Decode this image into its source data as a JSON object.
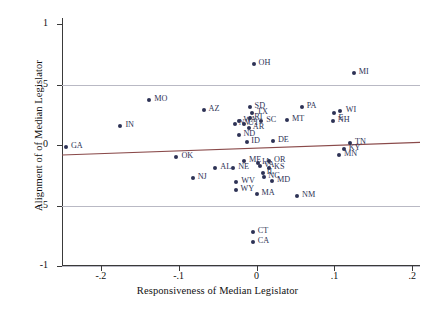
{
  "chart_data": {
    "type": "scatter",
    "title": "",
    "xlabel": "Responsiveness of Median Legislator",
    "ylabel": "Alignment of of Median Legislator",
    "xlim": [
      -0.25,
      0.21
    ],
    "ylim": [
      -1.0,
      1.05
    ],
    "xticks": [
      -0.2,
      -0.1,
      0,
      0.1,
      0.2
    ],
    "xticklabels": [
      "-.2",
      "-.1",
      "0",
      ".1",
      ".2"
    ],
    "yticks": [
      -1,
      -0.5,
      0,
      0.5,
      1
    ],
    "yticklabels": [
      "-1",
      "-.5",
      "0",
      ".5",
      "1"
    ],
    "gridlines_y": [
      -1,
      -0.5,
      0.5
    ],
    "grid": true,
    "legend": "none",
    "marker_color": "#2d3255",
    "fit_line_color": "#8a4a4a",
    "grid_color": "#b9b9c4",
    "fit_line": {
      "x0": -0.25,
      "y0": -0.082,
      "x1": 0.21,
      "y1": 0.022
    },
    "points": [
      {
        "label": "GA",
        "x": -0.245,
        "y": -0.012,
        "lab_dx": 5,
        "lab_dy": 0
      },
      {
        "label": "IN",
        "x": -0.175,
        "y": 0.155,
        "lab_dx": 5,
        "lab_dy": 0
      },
      {
        "label": "MO",
        "x": -0.138,
        "y": 0.372,
        "lab_dx": 5,
        "lab_dy": 0
      },
      {
        "label": "OK",
        "x": -0.103,
        "y": -0.098,
        "lab_dx": 5,
        "lab_dy": 0
      },
      {
        "label": "NJ",
        "x": -0.082,
        "y": -0.272,
        "lab_dx": 5,
        "lab_dy": 0
      },
      {
        "label": "AZ",
        "x": -0.068,
        "y": 0.288,
        "lab_dx": 5,
        "lab_dy": 0
      },
      {
        "label": "AL",
        "x": -0.053,
        "y": -0.192,
        "lab_dx": 5,
        "lab_dy": 0
      },
      {
        "label": "NE",
        "x": -0.03,
        "y": -0.192,
        "lab_dx": 5,
        "lab_dy": 0
      },
      {
        "label": "WV",
        "x": -0.026,
        "y": -0.305,
        "lab_dx": 5,
        "lab_dy": 0
      },
      {
        "label": "WY",
        "x": -0.027,
        "y": -0.372,
        "lab_dx": 5,
        "lab_dy": 0
      },
      {
        "label": "ME",
        "x": -0.016,
        "y": -0.128,
        "lab_dx": 5,
        "lab_dy": 0
      },
      {
        "label": "MT",
        "x": 0.039,
        "y": 0.205,
        "lab_dx": 5,
        "lab_dy": 0
      },
      {
        "label": "SD",
        "x": -0.009,
        "y": 0.318,
        "lab_dx": 5,
        "lab_dy": 0
      },
      {
        "label": "TX",
        "x": -0.006,
        "y": 0.268,
        "lab_dx": 5,
        "lab_dy": 0
      },
      {
        "label": "RI",
        "x": -0.008,
        "y": 0.222,
        "lab_dx": 4,
        "lab_dy": 0
      },
      {
        "label": "SC",
        "x": 0.006,
        "y": 0.198,
        "lab_dx": 5,
        "lab_dy": 0
      },
      {
        "label": "WA",
        "x": -0.022,
        "y": 0.195,
        "lab_dx": 4,
        "lab_dy": 0
      },
      {
        "label": "NV",
        "x": -0.028,
        "y": 0.172,
        "lab_dx": 4,
        "lab_dy": 0
      },
      {
        "label": "UT",
        "x": -0.016,
        "y": 0.172,
        "lab_dx": 4,
        "lab_dy": 0
      },
      {
        "label": "AR",
        "x": -0.01,
        "y": 0.138,
        "lab_dx": 4,
        "lab_dy": 0
      },
      {
        "label": "ND",
        "x": -0.022,
        "y": 0.085,
        "lab_dx": 4,
        "lab_dy": 0
      },
      {
        "label": "ID",
        "x": -0.012,
        "y": 0.022,
        "lab_dx": 4,
        "lab_dy": 0
      },
      {
        "label": "DE",
        "x": 0.021,
        "y": 0.035,
        "lab_dx": 5,
        "lab_dy": 0
      },
      {
        "label": "OH",
        "x": -0.004,
        "y": 0.668,
        "lab_dx": 5,
        "lab_dy": 0
      },
      {
        "label": "PA",
        "x": 0.058,
        "y": 0.318,
        "lab_dx": 5,
        "lab_dy": 0
      },
      {
        "label": "MI",
        "x": 0.125,
        "y": 0.592,
        "lab_dx": 5,
        "lab_dy": 0
      },
      {
        "label": "WI",
        "x": 0.107,
        "y": 0.282,
        "lab_dx": 6,
        "lab_dy": 0
      },
      {
        "label": "E",
        "x": 0.099,
        "y": 0.268,
        "lab_dx": 5,
        "lab_dy": 6
      },
      {
        "label": "NH",
        "x": 0.098,
        "y": 0.2,
        "lab_dx": 5,
        "lab_dy": 0
      },
      {
        "label": "KY",
        "x": 0.112,
        "y": -0.032,
        "lab_dx": 5,
        "lab_dy": 0
      },
      {
        "label": "TN",
        "x": 0.12,
        "y": 0.018,
        "lab_dx": 5,
        "lab_dy": 0
      },
      {
        "label": "MN",
        "x": 0.106,
        "y": -0.082,
        "lab_dx": 5,
        "lab_dy": 0
      },
      {
        "label": "OR",
        "x": 0.016,
        "y": -0.135,
        "lab_dx": 5,
        "lab_dy": 0
      },
      {
        "label": "VA",
        "x": 0.004,
        "y": -0.172,
        "lab_dx": 4,
        "lab_dy": 0
      },
      {
        "label": "KS",
        "x": 0.016,
        "y": -0.192,
        "lab_dx": 5,
        "lab_dy": 0
      },
      {
        "label": "IA",
        "x": 0.002,
        "y": -0.152,
        "lab_dx": 4,
        "lab_dy": 0
      },
      {
        "label": "IL",
        "x": 0.008,
        "y": -0.232,
        "lab_dx": 4,
        "lab_dy": 0
      },
      {
        "label": "NC",
        "x": 0.01,
        "y": -0.265,
        "lab_dx": 4,
        "lab_dy": 0
      },
      {
        "label": "MD",
        "x": 0.02,
        "y": -0.3,
        "lab_dx": 5,
        "lab_dy": 0
      },
      {
        "label": "MA",
        "x": 0.0,
        "y": -0.402,
        "lab_dx": 5,
        "lab_dy": 0
      },
      {
        "label": "NM",
        "x": 0.052,
        "y": -0.418,
        "lab_dx": 5,
        "lab_dy": 0
      },
      {
        "label": "CT",
        "x": -0.005,
        "y": -0.718,
        "lab_dx": 5,
        "lab_dy": 0
      },
      {
        "label": "CA",
        "x": -0.005,
        "y": -0.802,
        "lab_dx": 5,
        "lab_dy": 0
      }
    ]
  }
}
